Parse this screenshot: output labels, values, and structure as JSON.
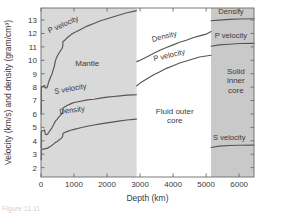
{
  "figure": {
    "caption_fragment": "Figure 11.11"
  },
  "chart_data": {
    "type": "line",
    "title": "",
    "xlabel": "Depth (km)",
    "ylabel": "Velocity (km/s) and density (gram/cm³)",
    "xlim": [
      0,
      6450
    ],
    "ylim": [
      1.3,
      13.9
    ],
    "xticks": [
      0,
      1000,
      2000,
      3000,
      4000,
      5000,
      6000
    ],
    "xtick_labels": [
      "0",
      "1000",
      "2000",
      "3000",
      "4000",
      "5000",
      "6000"
    ],
    "yticks": [
      2,
      3,
      4,
      5,
      6,
      7,
      8,
      9,
      10,
      11,
      12,
      13
    ],
    "ytick_labels": [
      "2",
      "3",
      "4",
      "5",
      "6",
      "7",
      "8",
      "9",
      "10",
      "11",
      "12",
      "13"
    ],
    "grid": false,
    "legend": "inline-curve-labels",
    "regions": [
      {
        "name": "Mantle",
        "label": "Mantle",
        "x_start": 0,
        "x_end": 2900,
        "shade": "#d9d9d9"
      },
      {
        "name": "Fluid outer core",
        "label": "Fluid outer\ncore",
        "label_line1": "Fluid outer",
        "label_line2": "core",
        "x_start": 2900,
        "x_end": 5150,
        "shade": "#ffffff"
      },
      {
        "name": "Solid inner core",
        "label_line1": "Solid",
        "label_line2": "inner",
        "label_line3": "core",
        "x_start": 5150,
        "x_end": 6450,
        "shade": "#c9c9c9"
      }
    ],
    "series": [
      {
        "name": "P velocity (mantle)",
        "label": "P velocity",
        "points": [
          [
            0,
            6.0
          ],
          [
            8,
            6.0
          ],
          [
            10,
            8.05
          ],
          [
            60,
            8.05
          ],
          [
            90,
            8.1
          ],
          [
            110,
            8.12
          ],
          [
            130,
            7.95
          ],
          [
            170,
            7.95
          ],
          [
            200,
            8.05
          ],
          [
            220,
            8.3
          ],
          [
            250,
            8.5
          ],
          [
            290,
            8.75
          ],
          [
            330,
            8.95
          ],
          [
            370,
            9.3
          ],
          [
            410,
            9.6
          ],
          [
            430,
            9.9
          ],
          [
            470,
            10.2
          ],
          [
            510,
            10.4
          ],
          [
            560,
            10.6
          ],
          [
            600,
            10.75
          ],
          [
            640,
            10.9
          ],
          [
            660,
            11.05
          ],
          [
            665,
            11.4
          ],
          [
            700,
            11.45
          ],
          [
            800,
            11.7
          ],
          [
            900,
            11.9
          ],
          [
            1000,
            12.05
          ],
          [
            1200,
            12.3
          ],
          [
            1400,
            12.55
          ],
          [
            1600,
            12.75
          ],
          [
            1800,
            12.95
          ],
          [
            2000,
            13.1
          ],
          [
            2200,
            13.25
          ],
          [
            2400,
            13.4
          ],
          [
            2600,
            13.55
          ],
          [
            2800,
            13.65
          ],
          [
            2890,
            13.7
          ]
        ]
      },
      {
        "name": "S velocity (mantle)",
        "label": "S velocity",
        "points": [
          [
            0,
            3.5
          ],
          [
            8,
            3.5
          ],
          [
            10,
            4.7
          ],
          [
            50,
            4.75
          ],
          [
            90,
            4.78
          ],
          [
            110,
            4.8
          ],
          [
            130,
            4.5
          ],
          [
            170,
            4.45
          ],
          [
            200,
            4.5
          ],
          [
            230,
            4.6
          ],
          [
            260,
            4.72
          ],
          [
            300,
            4.85
          ],
          [
            340,
            5.0
          ],
          [
            380,
            5.2
          ],
          [
            410,
            5.35
          ],
          [
            450,
            5.5
          ],
          [
            490,
            5.6
          ],
          [
            530,
            5.75
          ],
          [
            570,
            5.85
          ],
          [
            610,
            5.95
          ],
          [
            650,
            6.1
          ],
          [
            660,
            6.25
          ],
          [
            665,
            6.45
          ],
          [
            700,
            6.5
          ],
          [
            800,
            6.65
          ],
          [
            900,
            6.75
          ],
          [
            1000,
            6.85
          ],
          [
            1200,
            6.95
          ],
          [
            1400,
            7.05
          ],
          [
            1600,
            7.1
          ],
          [
            1800,
            7.18
          ],
          [
            2000,
            7.25
          ],
          [
            2200,
            7.3
          ],
          [
            2400,
            7.35
          ],
          [
            2600,
            7.4
          ],
          [
            2800,
            7.42
          ],
          [
            2890,
            7.43
          ]
        ]
      },
      {
        "name": "Density (mantle)",
        "label": "Density",
        "points": [
          [
            0,
            2.6
          ],
          [
            8,
            2.6
          ],
          [
            10,
            3.38
          ],
          [
            60,
            3.38
          ],
          [
            90,
            3.4
          ],
          [
            120,
            3.4
          ],
          [
            150,
            3.42
          ],
          [
            200,
            3.45
          ],
          [
            230,
            3.5
          ],
          [
            260,
            3.55
          ],
          [
            300,
            3.6
          ],
          [
            340,
            3.68
          ],
          [
            380,
            3.75
          ],
          [
            410,
            3.82
          ],
          [
            450,
            3.9
          ],
          [
            490,
            3.95
          ],
          [
            530,
            4.02
          ],
          [
            570,
            4.1
          ],
          [
            610,
            4.18
          ],
          [
            650,
            4.3
          ],
          [
            660,
            4.4
          ],
          [
            665,
            4.55
          ],
          [
            700,
            4.6
          ],
          [
            800,
            4.7
          ],
          [
            900,
            4.78
          ],
          [
            1000,
            4.85
          ],
          [
            1200,
            4.97
          ],
          [
            1400,
            5.08
          ],
          [
            1600,
            5.18
          ],
          [
            1800,
            5.26
          ],
          [
            2000,
            5.34
          ],
          [
            2200,
            5.41
          ],
          [
            2400,
            5.48
          ],
          [
            2600,
            5.55
          ],
          [
            2800,
            5.6
          ],
          [
            2890,
            5.62
          ]
        ]
      },
      {
        "name": "Density (outer core)",
        "label": "Density",
        "points": [
          [
            2900,
            9.9
          ],
          [
            3000,
            10.0
          ],
          [
            3200,
            10.25
          ],
          [
            3400,
            10.5
          ],
          [
            3600,
            10.75
          ],
          [
            3800,
            10.95
          ],
          [
            4000,
            11.15
          ],
          [
            4200,
            11.35
          ],
          [
            4400,
            11.5
          ],
          [
            4600,
            11.68
          ],
          [
            4800,
            11.82
          ],
          [
            5000,
            11.95
          ],
          [
            5150,
            12.15
          ]
        ]
      },
      {
        "name": "P velocity (outer core)",
        "label": "P velocity",
        "points": [
          [
            2900,
            8.1
          ],
          [
            3000,
            8.3
          ],
          [
            3200,
            8.6
          ],
          [
            3400,
            8.9
          ],
          [
            3600,
            9.15
          ],
          [
            3800,
            9.4
          ],
          [
            4000,
            9.6
          ],
          [
            4200,
            9.8
          ],
          [
            4400,
            9.95
          ],
          [
            4600,
            10.1
          ],
          [
            4800,
            10.25
          ],
          [
            5000,
            10.32
          ],
          [
            5150,
            10.38
          ]
        ]
      },
      {
        "name": "Density (inner core)",
        "label": "Density",
        "points": [
          [
            5150,
            12.95
          ],
          [
            5400,
            13.0
          ],
          [
            5700,
            13.05
          ],
          [
            6000,
            13.08
          ],
          [
            6450,
            13.1
          ]
        ]
      },
      {
        "name": "P velocity (inner core)",
        "label": "P velocity",
        "points": [
          [
            5150,
            11.05
          ],
          [
            5400,
            11.15
          ],
          [
            5700,
            11.2
          ],
          [
            6000,
            11.25
          ],
          [
            6450,
            11.26
          ]
        ]
      },
      {
        "name": "S velocity (inner core)",
        "label": "S velocity",
        "points": [
          [
            5150,
            3.5
          ],
          [
            5400,
            3.6
          ],
          [
            5700,
            3.65
          ],
          [
            6000,
            3.67
          ],
          [
            6450,
            3.68
          ]
        ]
      }
    ],
    "annotations": [
      {
        "name": "p-velocity-mantle-label",
        "text": "P velocity",
        "x": 700,
        "y": 12.5,
        "rotation": -24
      },
      {
        "name": "s-velocity-mantle-label",
        "text": "S velocity",
        "x": 900,
        "y": 7.7,
        "rotation": -10
      },
      {
        "name": "density-mantle-label",
        "text": "Density",
        "x": 950,
        "y": 6.1,
        "rotation": -8
      },
      {
        "name": "mantle-region-label",
        "text": "Mantle",
        "x": 1400,
        "y": 9.6,
        "rotation": 0
      },
      {
        "name": "density-outer-core-label",
        "text": "Density",
        "x": 3750,
        "y": 11.6,
        "rotation": -14
      },
      {
        "name": "p-velocity-outer-core-label",
        "text": "P velocity",
        "x": 3900,
        "y": 10.2,
        "rotation": -13
      },
      {
        "name": "fluid-outer-core-label",
        "text": "Fluid outer core",
        "x": 4050,
        "y": 6.0,
        "rotation": 0
      },
      {
        "name": "density-inner-core-label",
        "text": "Density",
        "x": 5750,
        "y": 13.45,
        "rotation": 0
      },
      {
        "name": "p-velocity-inner-core-label",
        "text": "P velocity",
        "x": 5750,
        "y": 11.65,
        "rotation": 0
      },
      {
        "name": "solid-inner-core-label",
        "text": "Solid inner core",
        "x": 5900,
        "y": 9.0,
        "rotation": 0
      },
      {
        "name": "s-velocity-inner-core-label",
        "text": "S velocity",
        "x": 5700,
        "y": 4.05,
        "rotation": 0
      }
    ],
    "colors": {
      "curve": "#555555",
      "frame": "#6b6b6b",
      "mantle_shade": "#d9d9d9",
      "outer_core_shade": "#ffffff",
      "inner_core_shade": "#c9c9c9",
      "text": "#3a3a3a",
      "background": "#ffffff"
    }
  }
}
